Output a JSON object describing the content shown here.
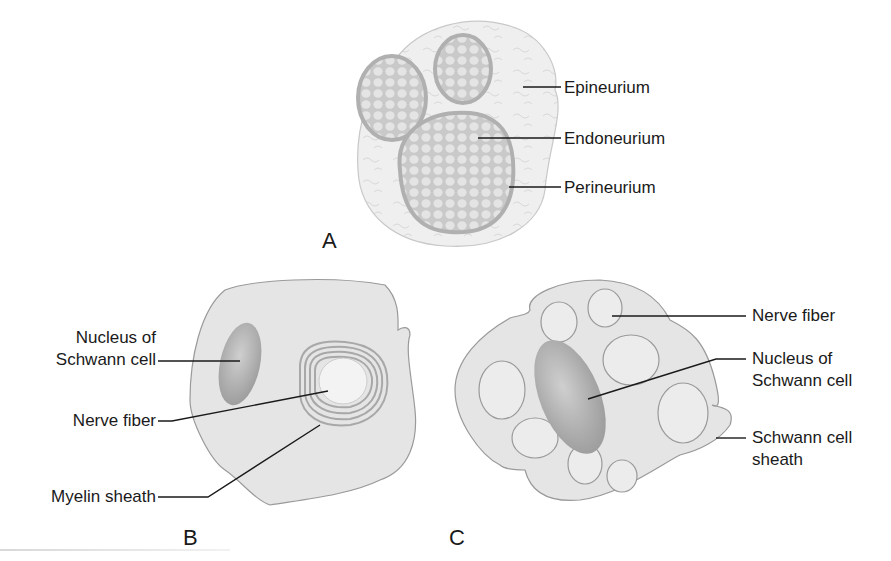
{
  "figure": {
    "panels": [
      {
        "id": "A",
        "label": "A",
        "description": "Cross-section of a peripheral nerve with three fascicles",
        "annotations": [
          {
            "text": "Epineurium"
          },
          {
            "text": "Endoneurium"
          },
          {
            "text": "Perineurium"
          }
        ]
      },
      {
        "id": "B",
        "label": "B",
        "description": "Myelinated nerve fiber wrapped by a Schwann cell",
        "annotations": [
          {
            "line1": "Nucleus of",
            "line2": "Schwann cell"
          },
          {
            "text": "Nerve fiber"
          },
          {
            "text": "Myelin sheath"
          }
        ]
      },
      {
        "id": "C",
        "label": "C",
        "description": "Unmyelinated nerve fibers embedded in a Schwann cell",
        "annotations": [
          {
            "text": "Nerve fiber"
          },
          {
            "line1": "Nucleus of",
            "line2": "Schwann cell"
          },
          {
            "line1": "Schwann cell",
            "line2": "sheath"
          }
        ]
      }
    ],
    "colors": {
      "background": "#ffffff",
      "cell_fill": "#e6e6e6",
      "cell_outline": "#9a9a9a",
      "fascicle_border": "#b5b5b5",
      "nucleus": "#a8a8a8",
      "leader_line": "#1a1a1a",
      "text": "#1a1a1a"
    }
  }
}
